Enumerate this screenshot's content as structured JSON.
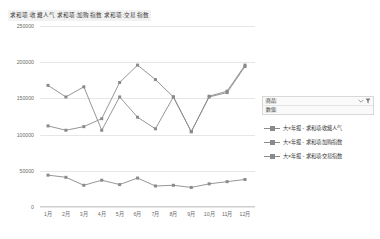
{
  "chart_title": "求和项:收藏人气  求和项:加购指数  求和项:交易指数",
  "filter": {
    "row1_label": "商品",
    "row2_label": "数值",
    "icon_name": "filter-funnel-icon"
  },
  "legend": {
    "position": "right",
    "items": [
      {
        "label": "大×年报 - 求和项:收藏人气",
        "color": "#8a8a8a"
      },
      {
        "label": "大×年报 - 求和项:加购指数",
        "color": "#8a8a8a"
      },
      {
        "label": "大×年报 - 求和项:交易指数",
        "color": "#8a8a8a"
      }
    ]
  },
  "chart_data": {
    "type": "line",
    "title": "求和项:收藏人气  求和项:加购指数  求和项:交易指数",
    "xlabel": "",
    "ylabel": "",
    "ylim": [
      0,
      250000
    ],
    "yticks": [
      0,
      50000,
      100000,
      150000,
      200000,
      250000
    ],
    "ytick_labels": [
      "0",
      "50000",
      "100000",
      "150000",
      "200000",
      "250000"
    ],
    "grid": true,
    "legend_position": "right",
    "categories": [
      "1月",
      "2月",
      "3月",
      "4月",
      "5月",
      "6月",
      "7月",
      "8月",
      "9月",
      "10月",
      "11月",
      "12月"
    ],
    "series": [
      {
        "name": "大×年报 - 求和项:收藏人气",
        "color": "#8a8a8a",
        "values": [
          168000,
          152000,
          166000,
          106000,
          152000,
          124000,
          108000,
          152000,
          104000,
          153000,
          160000,
          196000
        ]
      },
      {
        "name": "大×年报 - 求和项:加购指数",
        "color": "#8a8a8a",
        "values": [
          112000,
          106000,
          111000,
          122000,
          172000,
          196000,
          176000,
          152000,
          104000,
          152000,
          158000,
          194000
        ]
      },
      {
        "name": "大×年报 - 求和项:交易指数",
        "color": "#8a8a8a",
        "values": [
          44000,
          41000,
          30000,
          37000,
          31000,
          40000,
          29000,
          30000,
          27000,
          32000,
          35000,
          38000
        ]
      }
    ]
  }
}
